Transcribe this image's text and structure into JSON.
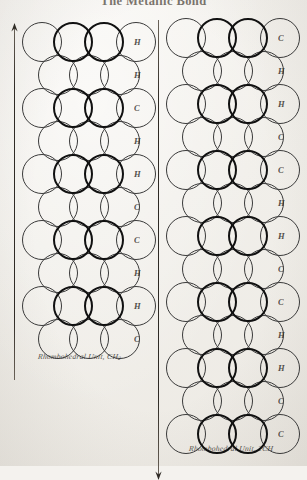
{
  "page": {
    "title": "The Metallic Bond",
    "background_color": "#f4f2ee",
    "ink_color": "#2e2a25"
  },
  "figures": [
    {
      "id": "left-figure",
      "caption_prefix": "Rhombohedral Unit, CH",
      "caption_subscript": "2",
      "axis": {
        "name": "vertical-axis-arrow",
        "direction": "up"
      },
      "labels": [
        "H",
        "H",
        "C",
        "H",
        "H",
        "C",
        "C",
        "H",
        "H",
        "C",
        "H"
      ],
      "rows": 10
    },
    {
      "id": "right-figure",
      "caption_prefix": "Rhombohedral Unit, 2CH",
      "caption_subscript": "",
      "axis": {
        "name": "vertical-axis-arrow",
        "direction": "down"
      },
      "labels": [
        "C",
        "H",
        "H",
        "C",
        "C",
        "H",
        "H",
        "C",
        "C",
        "H",
        "H",
        "C",
        "C"
      ],
      "rows": 13
    }
  ],
  "icons": {
    "arrow_up": "arrow-up-icon",
    "arrow_down": "arrow-down-icon"
  }
}
